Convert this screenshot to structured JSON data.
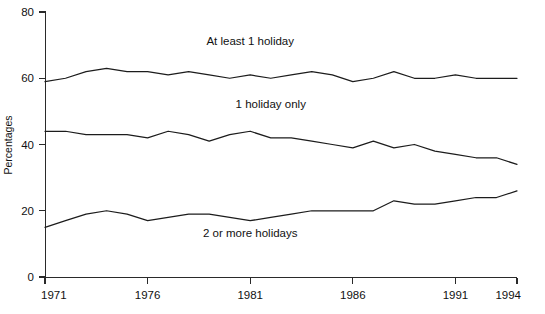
{
  "chart_data": {
    "type": "line",
    "title": "",
    "subtitle": "",
    "xlabel": "",
    "ylabel": "Percentages",
    "xlim": [
      1971,
      1994
    ],
    "ylim": [
      0,
      80
    ],
    "grid": false,
    "legend_position": "inline-annotations",
    "x": [
      1971,
      1972,
      1973,
      1974,
      1975,
      1976,
      1977,
      1978,
      1979,
      1980,
      1981,
      1982,
      1983,
      1984,
      1985,
      1986,
      1987,
      1988,
      1989,
      1990,
      1991,
      1992,
      1993,
      1994
    ],
    "xticks": [
      1971,
      1976,
      1981,
      1986,
      1991,
      1994
    ],
    "xtick_labels": [
      "1971",
      "1976",
      "1981",
      "1986",
      "1991",
      "1994"
    ],
    "yticks": [
      0,
      20,
      40,
      60,
      80
    ],
    "ytick_labels": [
      "0",
      "20",
      "40",
      "60",
      "80"
    ],
    "series": [
      {
        "name": "At least 1 holiday",
        "label_x": 1981,
        "label_y": 70,
        "values": [
          59,
          60,
          62,
          63,
          62,
          62,
          61,
          62,
          61,
          60,
          61,
          60,
          61,
          62,
          61,
          59,
          60,
          62,
          60,
          60,
          61,
          60,
          60,
          60
        ]
      },
      {
        "name": "1 holiday only",
        "label_x": 1982,
        "label_y": 51,
        "values": [
          44,
          44,
          43,
          43,
          43,
          42,
          44,
          43,
          41,
          43,
          44,
          42,
          42,
          41,
          40,
          39,
          41,
          39,
          40,
          38,
          37,
          36,
          36,
          34
        ]
      },
      {
        "name": "2 or more holidays",
        "label_x": 1981,
        "label_y": 12,
        "values": [
          15,
          17,
          19,
          20,
          19,
          17,
          18,
          19,
          19,
          18,
          17,
          18,
          19,
          20,
          20,
          20,
          20,
          23,
          22,
          22,
          23,
          24,
          24,
          26
        ]
      }
    ]
  },
  "axis": {
    "y_title": "Percentages"
  }
}
